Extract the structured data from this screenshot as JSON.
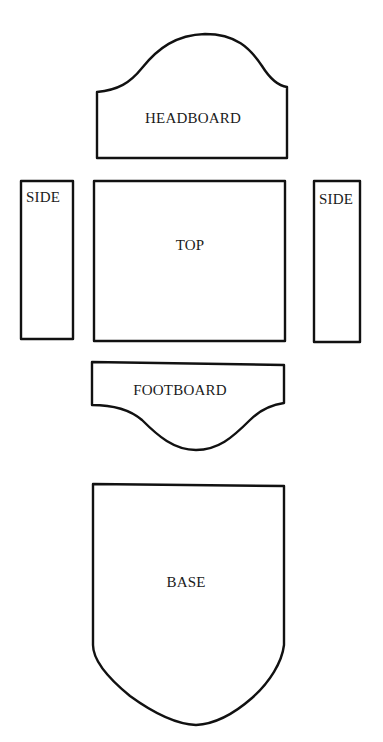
{
  "diagram": {
    "stroke_color": "#111111",
    "background": "#ffffff",
    "pieces": [
      {
        "id": "headboard",
        "label": "HEADBOARD"
      },
      {
        "id": "side-left",
        "label": "SIDE"
      },
      {
        "id": "top",
        "label": "TOP"
      },
      {
        "id": "side-right",
        "label": "SIDE"
      },
      {
        "id": "footboard",
        "label": "FOOTBOARD"
      },
      {
        "id": "base",
        "label": "BASE"
      }
    ]
  }
}
